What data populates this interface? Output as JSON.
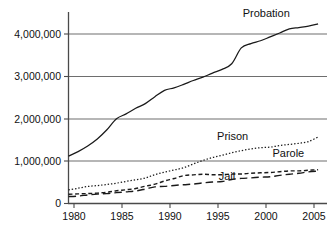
{
  "chart_data": {
    "type": "line",
    "title": "",
    "subtitle": "",
    "xlabel": "",
    "ylabel": "",
    "xlim": [
      1979.5,
      2006.2
    ],
    "ylim": [
      0,
      4400000
    ],
    "grid": "horizontal",
    "legend_position": "inline-annotations",
    "x_ticks": [
      "1980",
      "1985",
      "1990",
      "1995",
      "2000",
      "2005"
    ],
    "x_tick_values": [
      1980,
      1985,
      1990,
      1995,
      2000,
      2005
    ],
    "y_ticks": [
      "0",
      "1,000,000",
      "2,000,000",
      "3,000,000",
      "4,000,000"
    ],
    "y_tick_values": [
      0,
      1000000,
      2000000,
      3000000,
      4000000
    ],
    "x": [
      1980,
      1981,
      1982,
      1983,
      1984,
      1985,
      1986,
      1987,
      1988,
      1989,
      1990,
      1991,
      1992,
      1993,
      1994,
      1995,
      1996,
      1997,
      1998,
      1999,
      2000,
      2001,
      2002,
      2003,
      2004,
      2005,
      2006
    ],
    "series": [
      {
        "name": "Probation",
        "style": "solid",
        "values": [
          1118000,
          1225000,
          1357000,
          1522000,
          1740000,
          2000000,
          2115000,
          2247000,
          2356000,
          2520000,
          2670000,
          2729000,
          2812000,
          2903000,
          2981000,
          3078000,
          3164000,
          3297000,
          3671000,
          3773000,
          3840000,
          3932000,
          4024000,
          4120000,
          4152000,
          4185000,
          4237000
        ]
      },
      {
        "name": "Prison",
        "style": "dotted",
        "values": [
          320000,
          360000,
          402000,
          423000,
          449000,
          480000,
          522000,
          560000,
          603000,
          680000,
          740000,
          790000,
          846000,
          932000,
          1016000,
          1085000,
          1138000,
          1197000,
          1246000,
          1287000,
          1316000,
          1330000,
          1368000,
          1394000,
          1421000,
          1462000,
          1570000
        ]
      },
      {
        "name": "Parole",
        "style": "short-dash",
        "values": [
          220000,
          226000,
          235000,
          246000,
          266000,
          300000,
          325000,
          355000,
          408000,
          456000,
          531000,
          590000,
          658000,
          676000,
          690000,
          679000,
          680000,
          695000,
          696000,
          714000,
          724000,
          732000,
          750000,
          769000,
          771000,
          784000,
          798000
        ]
      },
      {
        "name": "Jail",
        "style": "long-dash",
        "values": [
          164000,
          176000,
          201000,
          222000,
          234000,
          256000,
          274000,
          295000,
          341000,
          393000,
          405000,
          426000,
          444000,
          459000,
          486000,
          507000,
          518000,
          567000,
          592000,
          605000,
          621000,
          631000,
          665000,
          691000,
          714000,
          747000,
          766000
        ]
      }
    ],
    "annotations": [
      {
        "text": "Probation",
        "x": 2000.6,
        "y": 4400000
      },
      {
        "text": "Prison",
        "x": 1997.1,
        "y": 1500000
      },
      {
        "text": "Parole",
        "x": 2002.9,
        "y": 1090000
      },
      {
        "text": "Jail",
        "x": 1996.5,
        "y": 560000
      }
    ],
    "colors": {
      "line": "#1a1a1a",
      "grid": "#6e6e6e",
      "axis": "#4a4a4a",
      "text": "#111111",
      "background": "#ffffff"
    }
  }
}
